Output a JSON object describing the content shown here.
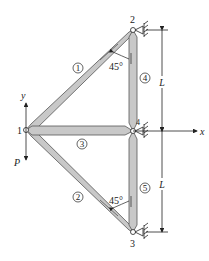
{
  "diagram": {
    "type": "plane truss",
    "nodes": [
      {
        "id": "1",
        "label": "1",
        "x": 26,
        "y": 130
      },
      {
        "id": "2",
        "label": "2",
        "x": 133,
        "y": 30
      },
      {
        "id": "3",
        "label": "3",
        "x": 133,
        "y": 232
      },
      {
        "id": "4",
        "label": "4",
        "x": 133,
        "y": 131
      }
    ],
    "elements": [
      {
        "id": "1",
        "label": "1",
        "from": "1",
        "to": "2"
      },
      {
        "id": "2",
        "label": "2",
        "from": "1",
        "to": "3"
      },
      {
        "id": "3",
        "label": "3",
        "from": "1",
        "to": "4"
      },
      {
        "id": "4",
        "label": "4",
        "from": "2",
        "to": "4"
      },
      {
        "id": "5",
        "label": "5",
        "from": "4",
        "to": "3"
      }
    ],
    "angles": [
      {
        "label": "45°",
        "between": [
          "element 1",
          "element 4"
        ]
      },
      {
        "label": "45°",
        "between": [
          "element 2",
          "element 5"
        ]
      }
    ],
    "dimensions": [
      {
        "label": "L",
        "span": "node 2 to node 4"
      },
      {
        "label": "L",
        "span": "node 4 to node 3"
      }
    ],
    "axes": {
      "x_label": "x",
      "y_label": "y"
    },
    "load": {
      "label": "P",
      "node": "1",
      "direction": "down"
    },
    "supports": [
      "node 2",
      "node 3",
      "node 4"
    ],
    "colors": {
      "member_fill": "#c8c8c8",
      "member_stroke": "#555555",
      "line": "#222222"
    }
  }
}
